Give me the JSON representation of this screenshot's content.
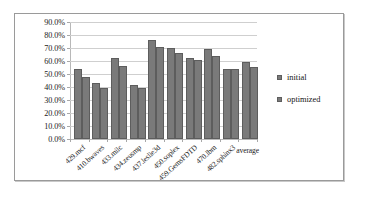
{
  "chart_data": {
    "type": "bar",
    "title": "",
    "xlabel": "",
    "ylabel": "",
    "ylim": [
      0,
      90
    ],
    "ytick_labels": [
      "90.0%",
      "80.0%",
      "70.0%",
      "60.0%",
      "50.0%",
      "40.0%",
      "30.0%",
      "20.0%",
      "10.0%",
      "0.0%"
    ],
    "ytick_values": [
      90,
      80,
      70,
      60,
      50,
      40,
      30,
      20,
      10,
      0
    ],
    "grid": true,
    "legend_position": "right",
    "categories": [
      "429.mcf",
      "410.bwaves",
      "433.milc",
      "434.zeusmp",
      "437.leslie3d",
      "450.soplex",
      "459.GemsFDTD",
      "470.lbm",
      "482.sphinx3",
      "average"
    ],
    "series": [
      {
        "name": "initial",
        "color": "#7a7a7a",
        "values": [
          54.0,
          43.0,
          62.0,
          41.5,
          76.0,
          70.0,
          62.5,
          69.0,
          54.0,
          59.0
        ]
      },
      {
        "name": "optimized",
        "color": "#7a7a7a",
        "values": [
          48.0,
          39.5,
          56.0,
          39.5,
          70.5,
          66.5,
          60.5,
          63.5,
          53.5,
          55.5
        ]
      }
    ]
  },
  "legend": {
    "items": [
      {
        "label": "initial"
      },
      {
        "label": "optimized"
      }
    ]
  }
}
